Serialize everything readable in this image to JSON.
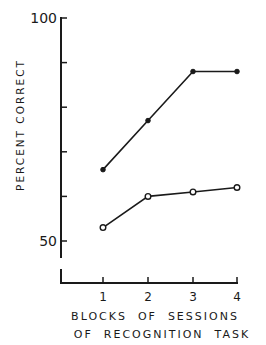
{
  "chart_data": {
    "type": "line",
    "title": "",
    "xlabel": "BLOCKS OF SESSIONS OF RECOGNITION TASK",
    "xlabel_lines": [
      "BLOCKS  OF  SESSIONS",
      "OF  RECOGNITION  TASK"
    ],
    "ylabel": "PERCENT CORRECT",
    "x": [
      1,
      2,
      3,
      4
    ],
    "x_tick_labels": [
      "1",
      "2",
      "3",
      "4"
    ],
    "y_tick_labels": [
      "100",
      "50"
    ],
    "ylim": [
      50,
      100
    ],
    "y_ticks": [
      50,
      60,
      70,
      80,
      90,
      100
    ],
    "y_axis_break": true,
    "grid": false,
    "legend": "none",
    "series": [
      {
        "name": "filled circles",
        "marker": "filled-circle",
        "values": [
          66,
          77,
          88,
          88
        ]
      },
      {
        "name": "open circles",
        "marker": "open-circle",
        "values": [
          53,
          60,
          61,
          62
        ]
      }
    ]
  }
}
